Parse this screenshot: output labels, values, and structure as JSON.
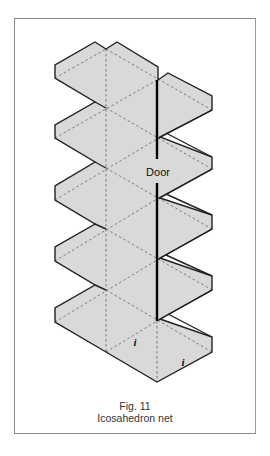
{
  "figure": {
    "number_label": "Fig. 11",
    "title": "Icosahedron net",
    "colors": {
      "face_fill": "#d9d9d9",
      "cut_line": "#222222",
      "fold_line": "#6e6e6e",
      "door_line": "#000000",
      "frame": "#8a8a8a"
    },
    "labels": {
      "door": "Door",
      "face_marker_1": "i",
      "face_marker_2": "i"
    },
    "label_positions": {
      "door": [
        158,
        176
      ],
      "face_marker_1": [
        135,
        346
      ],
      "face_marker_2": [
        183,
        366
      ]
    }
  },
  "chart_data": {
    "type": "diagram",
    "title": "Icosahedron net",
    "caption": "Fig. 11",
    "outline": [
      [
        95,
        42
      ],
      [
        106,
        49
      ],
      [
        117,
        42
      ],
      [
        158,
        67
      ],
      [
        158,
        80
      ],
      [
        168,
        73
      ],
      [
        212,
        96
      ],
      [
        212,
        110
      ],
      [
        160,
        137
      ],
      [
        212,
        157
      ],
      [
        212,
        169
      ],
      [
        160,
        198
      ],
      [
        212,
        215
      ],
      [
        212,
        229
      ],
      [
        160,
        258
      ],
      [
        212,
        276
      ],
      [
        212,
        290
      ],
      [
        160,
        319
      ],
      [
        212,
        337
      ],
      [
        212,
        352
      ],
      [
        157,
        382
      ],
      [
        106,
        352
      ],
      [
        55,
        322
      ],
      [
        55,
        308
      ],
      [
        95,
        285
      ],
      [
        55,
        261
      ],
      [
        55,
        247
      ],
      [
        95,
        224
      ],
      [
        55,
        200
      ],
      [
        55,
        186
      ],
      [
        95,
        162
      ],
      [
        55,
        138
      ],
      [
        55,
        125
      ],
      [
        95,
        102
      ],
      [
        55,
        78
      ],
      [
        55,
        65
      ]
    ],
    "cut_stubs": [
      [
        [
          95,
          102
        ],
        [
          106,
          108
        ]
      ],
      [
        [
          95,
          162
        ],
        [
          106,
          168
        ]
      ],
      [
        [
          95,
          224
        ],
        [
          106,
          229
        ]
      ],
      [
        [
          95,
          285
        ],
        [
          106,
          290
        ]
      ],
      [
        [
          212,
          110
        ],
        [
          157,
          139
        ]
      ],
      [
        [
          166,
          133
        ],
        [
          212,
          157
        ]
      ],
      [
        [
          212,
          169
        ],
        [
          157,
          199
        ]
      ],
      [
        [
          166,
          194
        ],
        [
          212,
          215
        ]
      ],
      [
        [
          212,
          229
        ],
        [
          157,
          260
        ]
      ],
      [
        [
          166,
          255
        ],
        [
          212,
          276
        ]
      ],
      [
        [
          212,
          290
        ],
        [
          157,
          321
        ]
      ],
      [
        [
          168,
          314
        ],
        [
          212,
          337
        ]
      ]
    ],
    "fold_lines": [
      [
        [
          106,
          49
        ],
        [
          106,
          352
        ]
      ],
      [
        [
          157,
          321
        ],
        [
          157,
          382
        ]
      ],
      [
        [
          55,
          78
        ],
        [
          106,
          49
        ]
      ],
      [
        [
          55,
          138
        ],
        [
          157,
          80
        ]
      ],
      [
        [
          55,
          200
        ],
        [
          157,
          139
        ]
      ],
      [
        [
          55,
          261
        ],
        [
          157,
          199
        ]
      ],
      [
        [
          55,
          322
        ],
        [
          157,
          260
        ]
      ],
      [
        [
          106,
          352
        ],
        [
          157,
          321
        ]
      ],
      [
        [
          106,
          49
        ],
        [
          212,
          110
        ]
      ],
      [
        [
          106,
          108
        ],
        [
          212,
          169
        ]
      ],
      [
        [
          106,
          168
        ],
        [
          212,
          229
        ]
      ],
      [
        [
          106,
          229
        ],
        [
          212,
          290
        ]
      ],
      [
        [
          106,
          290
        ],
        [
          212,
          352
        ]
      ]
    ],
    "door_line_segments": [
      [
        [
          157,
          80
        ],
        [
          157,
          159
        ]
      ],
      [
        [
          157,
          183
        ],
        [
          157,
          321
        ]
      ]
    ]
  }
}
